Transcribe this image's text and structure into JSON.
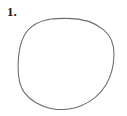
{
  "page": {
    "width": 127,
    "height": 116,
    "background_color": "#ffffff",
    "kind": "worksheet-figure"
  },
  "item": {
    "number_label": "1.",
    "number_color": "#1a1a1a"
  },
  "figure": {
    "name": "hand-drawn-circle",
    "shape": "circle",
    "style": "freehand",
    "stroke_color": "#6a6a6a",
    "fill": "none",
    "stroke_width": 1.05,
    "bounds": {
      "left": 18,
      "top": 18,
      "right": 114,
      "bottom": 110,
      "width": 96,
      "height": 92
    },
    "center": {
      "x": 66,
      "y": 64
    },
    "path": "M 66.5 18.4 C 80.5 18.2 94.0 22.0 103.4 29.6 C 111.2 35.9 114.2 45.0 114.0 54.6 C 113.8 65.0 111.6 75.4 106.2 84.4 C 100.6 93.8 91.6 101.4 81.0 105.8 C 71.6 109.7 61.0 110.5 51.0 108.4 C 40.6 106.2 30.8 100.8 24.4 92.6 C 18.4 84.9 17.9 74.8 18.1 65.0 C 18.3 54.8 19.2 44.2 24.4 35.2 C 29.8 25.8 40.2 20.8 51.0 19.1 C 56.1 18.3 61.3 18.4 66.5 18.4 Z"
  }
}
